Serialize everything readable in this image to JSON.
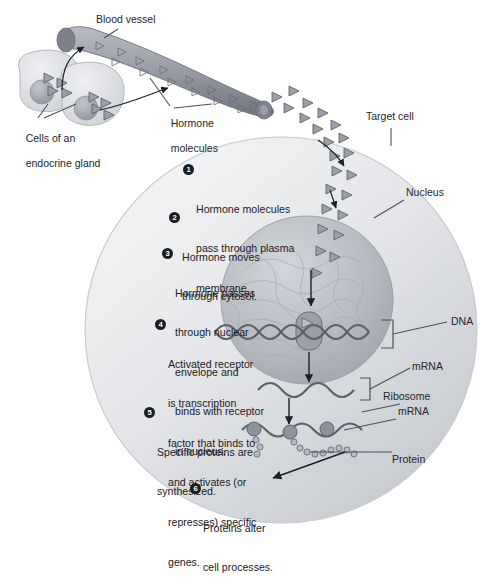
{
  "figure": {
    "title_cutoff": "",
    "background": "#ffffff"
  },
  "colors": {
    "cell_fill_light": "#e9eaec",
    "cell_fill_mid": "#cdd0d4",
    "cell_edge": "#b9bcc1",
    "nucleus_fill": "#b9bdc3",
    "nucleus_edge": "#9ea3aa",
    "vessel_fill": "#9fa4ab",
    "vessel_dark": "#6f747c",
    "gland_fill": "#d9dbdf",
    "gland_nucleus": "#a9aeb5",
    "hormone_fill": "#9aa0a8",
    "hormone_edge": "#5f646b",
    "line": "#1d2024",
    "text": "#23262b",
    "bullet_bg": "#1b1d20",
    "bullet_text": "#ffffff"
  },
  "labels": [
    {
      "id": "blood-vessel",
      "text": "Blood vessel",
      "x": 96,
      "y": 19
    },
    {
      "id": "hormone-molecules",
      "line1": "Hormone",
      "line2": "molecules",
      "x": 159,
      "y": 109
    },
    {
      "id": "cells-endocrine-gland",
      "line1": "Cells of an",
      "line2": "endocrine gland",
      "x": 14,
      "y": 122
    },
    {
      "id": "target-cell",
      "text": "Target cell",
      "x": 369,
      "y": 115
    },
    {
      "id": "nucleus",
      "text": "Nucleus",
      "x": 406,
      "y": 190
    },
    {
      "id": "dna",
      "text": "DNA",
      "x": 451,
      "y": 320
    },
    {
      "id": "mrna-nuclear",
      "text": "mRNA",
      "x": 414,
      "y": 364
    },
    {
      "id": "ribosome",
      "text": "Ribosome",
      "x": 385,
      "y": 394
    },
    {
      "id": "mrna-cyto",
      "text": "mRNA",
      "x": 399,
      "y": 409
    },
    {
      "id": "protein",
      "text": "Protein",
      "x": 393,
      "y": 458
    }
  ],
  "steps": [
    {
      "num": "1",
      "x": 196,
      "y": 163,
      "lines": [
        "Hormone molecules",
        "pass through plasma",
        "membrane."
      ]
    },
    {
      "num": "2",
      "x": 182,
      "y": 211,
      "lines": [
        "Hormone moves",
        "through cytosol."
      ]
    },
    {
      "num": "3",
      "x": 175,
      "y": 247,
      "lines": [
        "Hormone passes",
        "through nuclear",
        "envelope and",
        "binds with receptor",
        "in nucleus."
      ]
    },
    {
      "num": "4",
      "x": 168,
      "y": 318,
      "lines": [
        "Activated receptor",
        "is transcription",
        "factor that binds to",
        "and activates (or",
        "represses) specific",
        "genes."
      ]
    },
    {
      "num": "5",
      "x": 157,
      "y": 406,
      "lines": [
        "Specific proteins are",
        "synthesized."
      ]
    },
    {
      "num": "6",
      "x": 203,
      "y": 482,
      "lines": [
        "Proteins alter",
        "cell processes."
      ]
    }
  ],
  "structures": {
    "blood_vessel": {
      "name": "blood-vessel-tube"
    },
    "gland_cells": {
      "name": "endocrine-gland-cells",
      "count": 2
    },
    "target_cell": {
      "name": "target-cell-body"
    },
    "nucleus": {
      "name": "cell-nucleus"
    },
    "dna": {
      "name": "dna-double-helix"
    },
    "receptor": {
      "name": "hormone-receptor-complex"
    },
    "mrna_nuclear": {
      "name": "mrna-strand-nuclear"
    },
    "mrna_cyto": {
      "name": "mrna-strand-cytosol"
    },
    "ribosomes": {
      "name": "ribosome-beads",
      "count": 3
    },
    "protein_chain": {
      "name": "protein-polypeptide-chain"
    },
    "hormone_molecules": {
      "name": "hormone-triangle-molecules"
    }
  }
}
